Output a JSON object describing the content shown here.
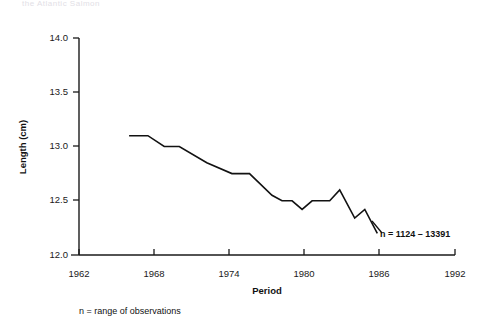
{
  "page": {
    "header_text": "the Atlantic Salmon"
  },
  "chart_data": {
    "type": "line",
    "title": "",
    "xlabel": "Period",
    "ylabel": "Length (cm)",
    "xlim": [
      1962,
      1992
    ],
    "ylim": [
      12.0,
      14.0
    ],
    "grid": false,
    "legend": "none",
    "xticks": [
      "1962",
      "1968",
      "1974",
      "1980",
      "1986",
      "1992"
    ],
    "yticks": [
      "12.0",
      "12.5",
      "13.0",
      "13.5",
      "14.0"
    ],
    "x": [
      1966,
      1967.5,
      1968.5,
      1969.5,
      1971,
      1972.5,
      1974,
      1975.5,
      1977,
      1978,
      1979.5,
      1981,
      1982.5,
      1984,
      1985
    ],
    "values": [
      13.1,
      13.1,
      13.0,
      13.0,
      12.85,
      12.75,
      12.75,
      12.6,
      12.5,
      12.42,
      12.5,
      12.5,
      12.6,
      12.35,
      12.42
    ],
    "series": [
      {
        "name": "Mean length",
        "points": [
          {
            "x": 1966.0,
            "y": 13.1
          },
          {
            "x": 1967.5,
            "y": 13.1
          },
          {
            "x": 1968.8,
            "y": 13.0
          },
          {
            "x": 1970.0,
            "y": 13.0
          },
          {
            "x": 1972.2,
            "y": 12.85
          },
          {
            "x": 1974.2,
            "y": 12.75
          },
          {
            "x": 1975.6,
            "y": 12.75
          },
          {
            "x": 1977.4,
            "y": 12.55
          },
          {
            "x": 1978.2,
            "y": 12.5
          },
          {
            "x": 1979.0,
            "y": 12.5
          },
          {
            "x": 1979.8,
            "y": 12.42
          },
          {
            "x": 1980.6,
            "y": 12.5
          },
          {
            "x": 1982.0,
            "y": 12.5
          },
          {
            "x": 1982.8,
            "y": 12.6
          },
          {
            "x": 1984.0,
            "y": 12.34
          },
          {
            "x": 1984.8,
            "y": 12.42
          },
          {
            "x": 1985.8,
            "y": 12.2
          }
        ]
      }
    ],
    "annotation": "n = 1124 – 13391",
    "footnote": "n = range of observations"
  }
}
